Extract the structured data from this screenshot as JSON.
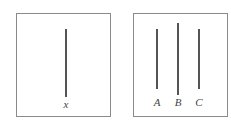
{
  "panels": [
    {
      "id": "left",
      "box": {
        "x": 16,
        "y": 13,
        "w": 95,
        "h": 104
      },
      "segments": [
        {
          "label": "x",
          "x": 66,
          "y_top": 29,
          "y_bottom": 97,
          "label_y": 99
        }
      ]
    },
    {
      "id": "right",
      "box": {
        "x": 133,
        "y": 13,
        "w": 95,
        "h": 104
      },
      "segments": [
        {
          "label": "A",
          "x": 157,
          "y_top": 29,
          "y_bottom": 89,
          "label_y": 97
        },
        {
          "label": "B",
          "x": 178,
          "y_top": 23,
          "y_bottom": 95,
          "label_y": 97
        },
        {
          "label": "C",
          "x": 199,
          "y_top": 29,
          "y_bottom": 89,
          "label_y": 97
        }
      ]
    }
  ],
  "colors": {
    "border": "#8a8a8a",
    "line": "#555555",
    "text": "#444444"
  }
}
